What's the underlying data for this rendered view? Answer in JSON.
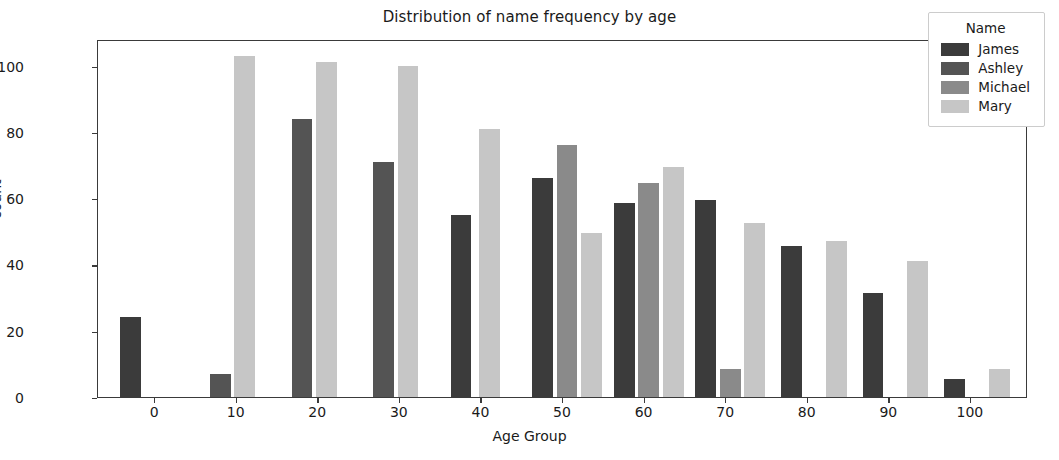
{
  "chart_data": {
    "type": "bar",
    "title": "Distribution of name frequency by age",
    "xlabel": "Age Group",
    "ylabel": "count",
    "xlim": [
      -7,
      107
    ],
    "ylim": [
      0,
      108
    ],
    "xticks": [
      0,
      10,
      20,
      30,
      40,
      50,
      60,
      70,
      80,
      90,
      100
    ],
    "yticks": [
      0,
      20,
      40,
      60,
      80,
      100
    ],
    "grid": false,
    "legend_title": "Name",
    "legend_position": "upper right",
    "categories": [
      0,
      10,
      20,
      30,
      40,
      50,
      60,
      70,
      80,
      90,
      100
    ],
    "series": [
      {
        "name": "James",
        "color": "#3b3b3b",
        "values": [
          24,
          null,
          null,
          null,
          55,
          66,
          58.5,
          59.5,
          45.5,
          31.5,
          5.5
        ]
      },
      {
        "name": "Ashley",
        "color": "#545454",
        "values": [
          null,
          7,
          84,
          71,
          null,
          null,
          null,
          null,
          null,
          null,
          null
        ]
      },
      {
        "name": "Michael",
        "color": "#8a8a8a",
        "values": [
          null,
          null,
          null,
          null,
          null,
          76,
          64.5,
          8.5,
          null,
          null,
          null
        ]
      },
      {
        "name": "Mary",
        "color": "#c6c6c6",
        "values": [
          null,
          103,
          101,
          100,
          81,
          49.5,
          69.5,
          52.5,
          47,
          41,
          8.5
        ]
      }
    ],
    "bars": [
      {
        "series": "James",
        "age": 0,
        "x": -3.0,
        "value": 24,
        "color": "#3b3b3b"
      },
      {
        "series": "Ashley",
        "age": 10,
        "x": 8.0,
        "value": 7,
        "color": "#545454"
      },
      {
        "series": "Mary",
        "age": 10,
        "x": 11.0,
        "value": 103,
        "color": "#c6c6c6"
      },
      {
        "series": "Ashley",
        "age": 20,
        "x": 18.0,
        "value": 84,
        "color": "#545454"
      },
      {
        "series": "Mary",
        "age": 20,
        "x": 21.0,
        "value": 101,
        "color": "#c6c6c6"
      },
      {
        "series": "Ashley",
        "age": 30,
        "x": 28.0,
        "value": 71,
        "color": "#545454"
      },
      {
        "series": "Mary",
        "age": 30,
        "x": 31.0,
        "value": 100,
        "color": "#c6c6c6"
      },
      {
        "series": "James",
        "age": 40,
        "x": 37.5,
        "value": 55,
        "color": "#3b3b3b"
      },
      {
        "series": "Mary",
        "age": 40,
        "x": 41.0,
        "value": 81,
        "color": "#c6c6c6"
      },
      {
        "series": "James",
        "age": 50,
        "x": 47.5,
        "value": 66,
        "color": "#3b3b3b"
      },
      {
        "series": "Michael",
        "age": 50,
        "x": 50.5,
        "value": 76,
        "color": "#8a8a8a"
      },
      {
        "series": "Mary",
        "age": 50,
        "x": 53.5,
        "value": 49.5,
        "color": "#c6c6c6"
      },
      {
        "series": "James",
        "age": 60,
        "x": 57.5,
        "value": 58.5,
        "color": "#3b3b3b"
      },
      {
        "series": "Michael",
        "age": 60,
        "x": 60.5,
        "value": 64.5,
        "color": "#8a8a8a"
      },
      {
        "series": "Mary",
        "age": 60,
        "x": 63.5,
        "value": 69.5,
        "color": "#c6c6c6"
      },
      {
        "series": "James",
        "age": 70,
        "x": 67.5,
        "value": 59.5,
        "color": "#3b3b3b"
      },
      {
        "series": "Michael",
        "age": 70,
        "x": 70.5,
        "value": 8.5,
        "color": "#8a8a8a"
      },
      {
        "series": "Mary",
        "age": 70,
        "x": 73.5,
        "value": 52.5,
        "color": "#c6c6c6"
      },
      {
        "series": "James",
        "age": 80,
        "x": 78.0,
        "value": 45.5,
        "color": "#3b3b3b"
      },
      {
        "series": "Mary",
        "age": 80,
        "x": 83.5,
        "value": 47,
        "color": "#c6c6c6"
      },
      {
        "series": "James",
        "age": 90,
        "x": 88.0,
        "value": 31.5,
        "color": "#3b3b3b"
      },
      {
        "series": "Mary",
        "age": 90,
        "x": 93.5,
        "value": 41,
        "color": "#c6c6c6"
      },
      {
        "series": "James",
        "age": 100,
        "x": 98.0,
        "value": 5.5,
        "color": "#3b3b3b"
      },
      {
        "series": "Mary",
        "age": 100,
        "x": 103.5,
        "value": 8.5,
        "color": "#c6c6c6"
      }
    ]
  }
}
